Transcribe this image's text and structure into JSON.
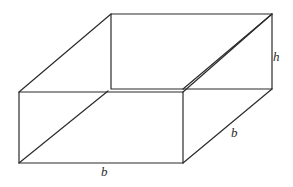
{
  "figure": {
    "name": "rectangular-prism",
    "background_color": "#ffffff",
    "stroke_color": "#2b2b2b",
    "stroke_width": 1.2,
    "canvas": {
      "width": 293,
      "height": 187
    },
    "labels": [
      {
        "id": "height",
        "text": "h",
        "x": 273,
        "y": 50
      },
      {
        "id": "depth",
        "text": "b",
        "x": 231,
        "y": 126
      },
      {
        "id": "width",
        "text": "b",
        "x": 101,
        "y": 165
      }
    ],
    "vertices": {
      "front_top_left": [
        19,
        92
      ],
      "front_top_right": [
        183,
        92
      ],
      "front_bottom_left": [
        19,
        163
      ],
      "front_bottom_right": [
        183,
        163
      ],
      "back_top_left": [
        111,
        14
      ],
      "back_top_right": [
        272,
        14
      ],
      "back_bottom_left": [
        111,
        89
      ],
      "back_bottom_right": [
        272,
        89
      ]
    },
    "edges": [
      {
        "id": "front-face-rect",
        "points": "19,92 183,92 183,163 19,163 19,92"
      },
      {
        "id": "back-face-rect",
        "points": "111,14 272,14 272,89 111,89 111,14"
      },
      {
        "id": "connector-top-left",
        "points": "19,92 111,14"
      },
      {
        "id": "connector-top-right",
        "points": "183,92 272,14"
      },
      {
        "id": "connector-bottom-right",
        "points": "183,163 272,89"
      },
      {
        "id": "diagonal-front-face",
        "points": "19,163 108,91"
      },
      {
        "id": "diagonal-back-face",
        "points": "183,89 272,14"
      }
    ]
  }
}
